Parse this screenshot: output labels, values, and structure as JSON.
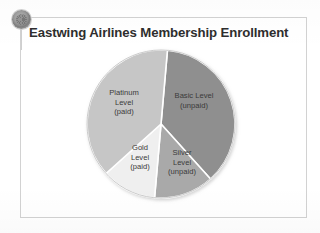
{
  "slide": {
    "title": "Eastwing Airlines Membership Enrollment",
    "logo_icon": "airline-seal-logo-icon",
    "frame_color": "#d2d2d2",
    "background": "#ffffff",
    "title_color": "#2e2e2e"
  },
  "chart_data": {
    "type": "pie",
    "title": "Eastwing Airlines Membership Enrollment",
    "xlabel": "",
    "ylabel": "",
    "legend_position": "none",
    "grid": false,
    "labels_inside_slices": true,
    "categories": [
      "Basic Level (unpaid)",
      "Silver Level (unpaid)",
      "Gold Level (paid)",
      "Platinum Level (paid)"
    ],
    "values": [
      37,
      13,
      12,
      38
    ],
    "units": "percent",
    "colors": [
      "#8f8f8f",
      "#a9a9a9",
      "#efefef",
      "#c6c6c6"
    ],
    "slice_separator_color": "#ffffff",
    "start_angle_deg": 5,
    "slices": [
      {
        "name": "Basic Level (unpaid)",
        "label_lines": [
          "Basic Level",
          "(unpaid)"
        ],
        "value": 37,
        "color": "#8f8f8f",
        "start_deg": 5,
        "end_deg": 138
      },
      {
        "name": "Silver Level (unpaid)",
        "label_lines": [
          "Silver",
          "Level",
          "(unpaid)"
        ],
        "value": 13,
        "color": "#a9a9a9",
        "start_deg": 138,
        "end_deg": 185
      },
      {
        "name": "Gold Level (paid)",
        "label_lines": [
          "Gold",
          "Level",
          "(paid)"
        ],
        "value": 12,
        "color": "#efefef",
        "start_deg": 185,
        "end_deg": 228
      },
      {
        "name": "Platinum Level (paid)",
        "label_lines": [
          "Platinum",
          "Level",
          "(paid)"
        ],
        "value": 38,
        "color": "#c6c6c6",
        "start_deg": 228,
        "end_deg": 365
      }
    ]
  },
  "labels": {
    "basic": {
      "line1": "Basic Level",
      "line2": "(unpaid)"
    },
    "platinum": {
      "line1": "Platinum",
      "line2": "Level",
      "line3": "(paid)"
    },
    "gold": {
      "line1": "Gold",
      "line2": "Level",
      "line3": "(paid)"
    },
    "silver": {
      "line1": "Silver",
      "line2": "Level",
      "line3": "(unpaid)"
    }
  }
}
